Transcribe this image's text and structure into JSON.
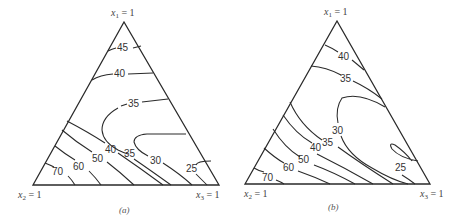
{
  "figure": {
    "panels": [
      {
        "id": "a",
        "caption": "(a)",
        "vertex_labels": {
          "top": {
            "var": "x",
            "sub": "1",
            "eq": " = 1"
          },
          "bottom_left": {
            "var": "x",
            "sub": "2",
            "eq": " = 1"
          },
          "bottom_right": {
            "var": "x",
            "sub": "3",
            "eq": " = 1"
          }
        },
        "contour_labels": [
          "45",
          "40",
          "35",
          "40",
          "35",
          "30",
          "25",
          "50",
          "60",
          "70"
        ]
      },
      {
        "id": "b",
        "caption": "(b)",
        "vertex_labels": {
          "top": {
            "var": "x",
            "sub": "1",
            "eq": " = 1"
          },
          "bottom_left": {
            "var": "x",
            "sub": "2",
            "eq": " = 1"
          },
          "bottom_right": {
            "var": "x",
            "sub": "3",
            "eq": " = 1"
          }
        },
        "contour_labels": [
          "40",
          "35",
          "30",
          "40",
          "35",
          "25",
          "50",
          "60",
          "70"
        ]
      }
    ]
  }
}
